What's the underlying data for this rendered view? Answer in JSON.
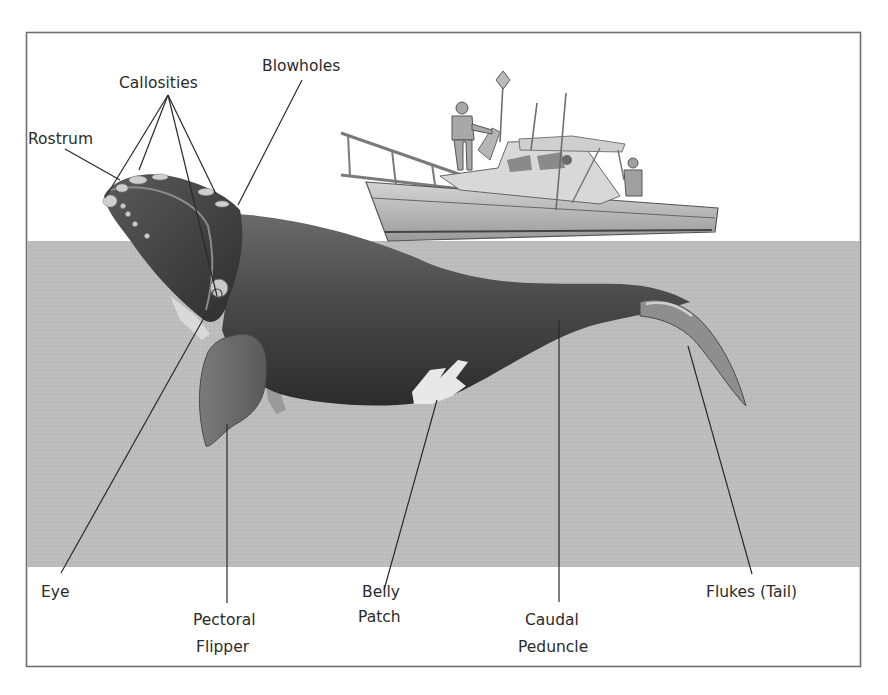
{
  "diagram": {
    "colors": {
      "frame": "#6f6f6f",
      "background": "#ffffff",
      "water": "#bdbdbd",
      "whale_dark": "#3a3a3a",
      "whale_mid": "#5e5e5e",
      "belly_patch": "#e6e6e6",
      "label_text": "#2b2b2b",
      "leader_line": "#2a2a2a"
    },
    "labels": {
      "callosities": "Callosities",
      "blowholes": "Blowholes",
      "rostrum": "Rostrum",
      "eye": "Eye",
      "pectoral_line1": "Pectoral",
      "pectoral_line2": "Flipper",
      "belly_line1": "Belly",
      "belly_line2": "Patch",
      "caudal_line1": "Caudal",
      "caudal_line2": "Peduncle",
      "flukes": "Flukes (Tail)"
    },
    "elements": {
      "boat": "boat-with-crew",
      "whale": "right-whale",
      "water": "water-surface"
    }
  }
}
